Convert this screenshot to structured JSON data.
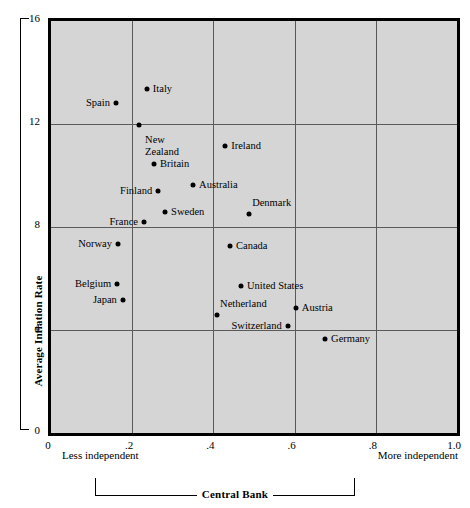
{
  "chart_data": {
    "type": "scatter",
    "title": "",
    "xlabel": "Central Bank",
    "ylabel": "Average Inflation Rate",
    "xlim": [
      0,
      1.0
    ],
    "ylim": [
      0,
      16
    ],
    "xticks": [
      "0",
      ".2",
      ".4",
      ".6",
      ".8",
      "1.0"
    ],
    "xtick_values": [
      0,
      0.2,
      0.4,
      0.6,
      0.8,
      1.0
    ],
    "yticks": [
      "0",
      "4",
      "8",
      "12",
      "16"
    ],
    "ytick_values": [
      0,
      4,
      8,
      12,
      16
    ],
    "grid": true,
    "legend": "none",
    "x_axis_left_note": "Less independent",
    "x_axis_right_note": "More independent",
    "points": [
      {
        "label": "Italy",
        "x": 0.236,
        "y": 13.35,
        "label_side": "right"
      },
      {
        "label": "Spain",
        "x": 0.16,
        "y": 12.8,
        "label_side": "left"
      },
      {
        "label": "New\nZealand",
        "x": 0.217,
        "y": 11.95,
        "label_side": "right"
      },
      {
        "label": "Ireland",
        "x": 0.429,
        "y": 11.15,
        "label_side": "right"
      },
      {
        "label": "Britain",
        "x": 0.254,
        "y": 10.45,
        "label_side": "right"
      },
      {
        "label": "Australia",
        "x": 0.35,
        "y": 9.65,
        "label_side": "right"
      },
      {
        "label": "Finland",
        "x": 0.264,
        "y": 9.4,
        "label_side": "left"
      },
      {
        "label": "Sweden",
        "x": 0.281,
        "y": 8.6,
        "label_side": "right"
      },
      {
        "label": "Denmark",
        "x": 0.488,
        "y": 8.5,
        "label_side": "above"
      },
      {
        "label": "France",
        "x": 0.229,
        "y": 8.2,
        "label_side": "left"
      },
      {
        "label": "Norway",
        "x": 0.165,
        "y": 7.35,
        "label_side": "left"
      },
      {
        "label": "Canada",
        "x": 0.441,
        "y": 7.25,
        "label_side": "right"
      },
      {
        "label": "Belgium",
        "x": 0.163,
        "y": 5.8,
        "label_side": "left"
      },
      {
        "label": "United States",
        "x": 0.468,
        "y": 5.7,
        "label_side": "right"
      },
      {
        "label": "Japan",
        "x": 0.177,
        "y": 5.15,
        "label_side": "left"
      },
      {
        "label": "Austria",
        "x": 0.603,
        "y": 4.85,
        "label_side": "right"
      },
      {
        "label": "Netherland",
        "x": 0.409,
        "y": 4.6,
        "label_side": "above"
      },
      {
        "label": "Switzerland",
        "x": 0.583,
        "y": 4.15,
        "label_side": "left"
      },
      {
        "label": "Germany",
        "x": 0.675,
        "y": 3.65,
        "label_side": "right"
      }
    ]
  }
}
